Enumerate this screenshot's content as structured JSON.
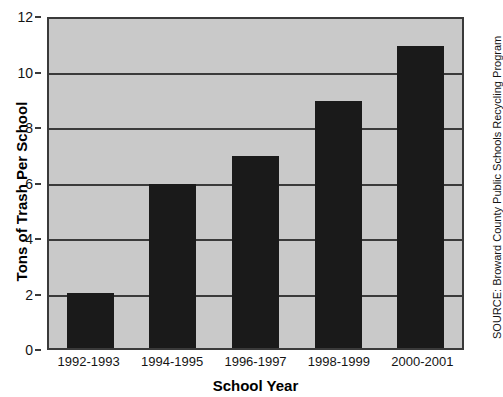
{
  "chart_data": {
    "type": "bar",
    "title": "",
    "xlabel": "School Year",
    "ylabel": "Tons of Trash Per School",
    "categories": [
      "1992-1993",
      "1994-1995",
      "1996-1997",
      "1998-1999",
      "2000-2001"
    ],
    "values": [
      2,
      6,
      7,
      9,
      11
    ],
    "ylim": [
      0,
      12
    ],
    "yticks": [
      0,
      2,
      4,
      6,
      8,
      10,
      12
    ],
    "grid": true,
    "legend": null,
    "annotations": [
      "SOURCE: Broward County Public Schools Recycling Program"
    ],
    "colors": {
      "bar": "#1a1a1a",
      "plot_background": "#c9c9c9",
      "gridline": "#3a3a3a",
      "axis": "#3a3a3a",
      "text": "#141414",
      "figure_background": "#ffffff"
    }
  },
  "source_note": "SOURCE: Broward County Public Schools Recycling Program"
}
